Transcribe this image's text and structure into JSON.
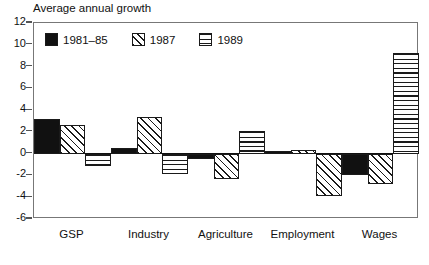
{
  "chart_data": {
    "type": "bar",
    "title": "Average annual growth",
    "xlabel": "",
    "ylabel": "",
    "ylim": [
      -6,
      12
    ],
    "ytick_step": 2,
    "yticks": [
      12,
      10,
      8,
      6,
      4,
      2,
      0,
      -2,
      -4,
      -6
    ],
    "ytick_labels": [
      "12",
      "10",
      "8",
      "6",
      "4",
      "2",
      "0",
      "-2",
      "-4",
      "-6"
    ],
    "grid": false,
    "legend_position": "top-left",
    "categories": [
      "GSP",
      "Industry",
      "Agriculture",
      "Employment",
      "Wages"
    ],
    "series": [
      {
        "name": "1981–85",
        "pattern": "solid",
        "color": "#111111",
        "values": [
          3.15,
          0.55,
          -0.5,
          0.1,
          -1.95
        ]
      },
      {
        "name": "1987",
        "pattern": "diagonal-hatch",
        "color": "#1a1a1a",
        "values": [
          2.65,
          3.35,
          -2.35,
          0.35,
          -2.8
        ]
      },
      {
        "name": "1989",
        "pattern": "horizontal-lines",
        "color": "#1a1a1a",
        "values": [
          -1.1,
          -1.9,
          2.1,
          -3.85,
          9.2
        ]
      }
    ],
    "bar_patterns_as_drawn": [
      [
        "solid",
        "diagonal-hatch",
        "horizontal-lines"
      ],
      [
        "solid",
        "diagonal-hatch",
        "horizontal-lines"
      ],
      [
        "solid",
        "diagonal-hatch",
        "horizontal-lines"
      ],
      [
        "solid",
        "diagonal-hatch",
        "diagonal-hatch"
      ],
      [
        "solid",
        "diagonal-hatch",
        "horizontal-lines"
      ]
    ]
  },
  "legend": {
    "items": [
      {
        "label": "1981–85",
        "pattern": "solid"
      },
      {
        "label": "1987",
        "pattern": "diagonal-hatch"
      },
      {
        "label": "1989",
        "pattern": "horizontal-lines"
      }
    ]
  },
  "colors": {
    "ink": "#111111",
    "frame": "#777777",
    "background": "#ffffff"
  }
}
